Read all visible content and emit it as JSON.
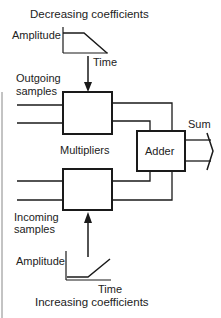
{
  "diagram": {
    "type": "crossfade-mixer-block-diagram",
    "top_graph": {
      "title": "Decreasing coefficients",
      "y_label": "Amplitude",
      "x_label": "Time",
      "shape": "flat-then-ramp-down"
    },
    "bottom_graph": {
      "title": "Increasing coefficients",
      "y_label": "Amplitude",
      "x_label": "Time",
      "shape": "flat-then-ramp-up"
    },
    "inputs": {
      "top": "Outgoing samples",
      "top_line1": "Outgoing",
      "top_line2": "samples",
      "bottom": "Incoming samples",
      "bottom_line1": "Incoming",
      "bottom_line2": "samples"
    },
    "blocks": {
      "multipliers_label": "Multipliers",
      "adder_label": "Adder"
    },
    "output": {
      "label": "Sum"
    },
    "colors": {
      "stroke": "#1a1a1a",
      "background": "#ffffff"
    }
  }
}
